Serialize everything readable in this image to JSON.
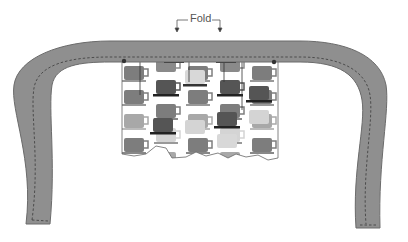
{
  "diagram": {
    "annotations": {
      "fold_label": "Fold"
    },
    "colors": {
      "strap_fill": "#8f8f8f",
      "strap_stroke": "#6b6b6b",
      "stitch": "#3a3a3a",
      "fabric_background": "#ffffff",
      "mug_dark": "#555555",
      "mug_medium": "#7d7d7d",
      "mug_light": "#a8a8a8",
      "mug_pale": "#d4d4d4",
      "saucer": "#222222",
      "pin": "#333333"
    },
    "parts": [
      {
        "name": "strap",
        "description": "U-shaped gray strap with dashed stitching line along inner edge"
      },
      {
        "name": "fabric-panel",
        "description": "Coffee-mug print fabric attached under the strap, with ragged bottom edge"
      },
      {
        "name": "pin-left",
        "description": "Pin marking left attachment point"
      },
      {
        "name": "pin-right",
        "description": "Pin marking right attachment point"
      },
      {
        "name": "fold-indicator",
        "description": "Bracket with two down arrows labeled Fold"
      }
    ]
  }
}
